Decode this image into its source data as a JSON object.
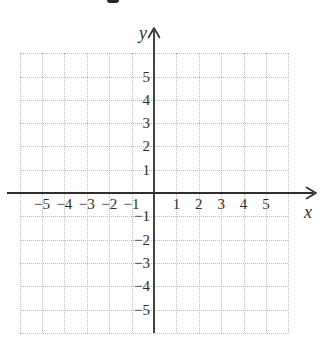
{
  "chart_data": {
    "type": "scatter",
    "title": "",
    "subtitle": "",
    "xlabel": "x",
    "ylabel": "y",
    "xlim": [
      -6,
      6
    ],
    "ylim": [
      -6,
      6
    ],
    "x_tick_values": [
      -5,
      -4,
      -3,
      -2,
      -1,
      1,
      2,
      3,
      4,
      5
    ],
    "x_tick_labels": [
      "−5",
      "−4",
      "−3",
      "−2",
      "−1",
      "1",
      "2",
      "3",
      "4",
      "5"
    ],
    "y_tick_values": [
      5,
      4,
      3,
      2,
      1,
      -1,
      -2,
      -3,
      -4,
      -5
    ],
    "y_tick_labels": [
      "5",
      "4",
      "3",
      "2",
      "1",
      "−1",
      "−2",
      "−3",
      "−4",
      "−5"
    ],
    "series": [],
    "grid": {
      "style": "dotted",
      "step": 1,
      "x_range": [
        -6,
        6
      ],
      "y_range": [
        -6,
        6
      ]
    },
    "legend": null
  },
  "colors": {
    "axis": "#2e2e2e",
    "grid_dots": "#bdbdbd",
    "text": "#2e2e2e",
    "background": "#ffffff"
  }
}
